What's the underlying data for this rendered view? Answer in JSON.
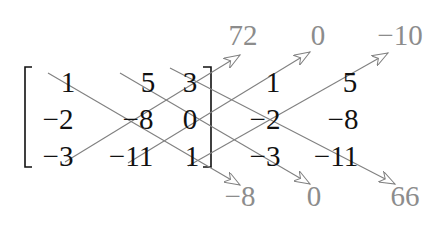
{
  "matrix": {
    "rows": [
      [
        "1",
        "5",
        "3"
      ],
      [
        "−2",
        "−8",
        "0"
      ],
      [
        "−3",
        "−11",
        "1"
      ]
    ]
  },
  "augmented_columns": {
    "rows": [
      [
        "1",
        "5"
      ],
      [
        "−2",
        "−8"
      ],
      [
        "−3",
        "−11"
      ]
    ]
  },
  "up_diagonal_products": [
    "72",
    "0",
    "−10"
  ],
  "down_diagonal_products": [
    "−8",
    "0",
    "66"
  ],
  "colors": {
    "matrix_text": "#111111",
    "product_text": "#8c8c8c",
    "arrow": "#808080",
    "bracket": "#111111"
  }
}
